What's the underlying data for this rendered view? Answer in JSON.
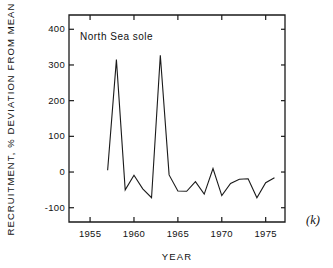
{
  "figure": {
    "panel_letter": "(k)",
    "annotation": "North Sea sole"
  },
  "chart_data": {
    "type": "line",
    "title": "",
    "annotation": "North Sea sole",
    "xlabel": "YEAR",
    "ylabel": "RECRUITMENT, % DEVIATION FROM MEAN",
    "xlim": [
      1952.6,
      1977.2
    ],
    "ylim": [
      -140,
      440
    ],
    "grid": false,
    "legend": "none",
    "xticks": [
      1955,
      1960,
      1965,
      1970,
      1975
    ],
    "xtick_labels": [
      "1955",
      "1960",
      "1965",
      "1970",
      "1975"
    ],
    "yticks": [
      -100,
      0,
      100,
      200,
      300,
      400
    ],
    "ytick_labels": [
      "-100",
      "0",
      "100",
      "200",
      "300",
      "400"
    ],
    "series": [
      {
        "name": "North Sea sole",
        "x": [
          1957,
          1958,
          1959,
          1960,
          1961,
          1962,
          1963,
          1964,
          1965,
          1966,
          1967,
          1968,
          1969,
          1970,
          1971,
          1972,
          1973,
          1974,
          1975,
          1976
        ],
        "values": [
          5,
          315,
          -50,
          -9,
          -47,
          -72,
          327,
          -8,
          -53,
          -54,
          -27,
          -62,
          10,
          -66,
          -32,
          -20,
          -19,
          -72,
          -30,
          -16
        ]
      }
    ]
  }
}
